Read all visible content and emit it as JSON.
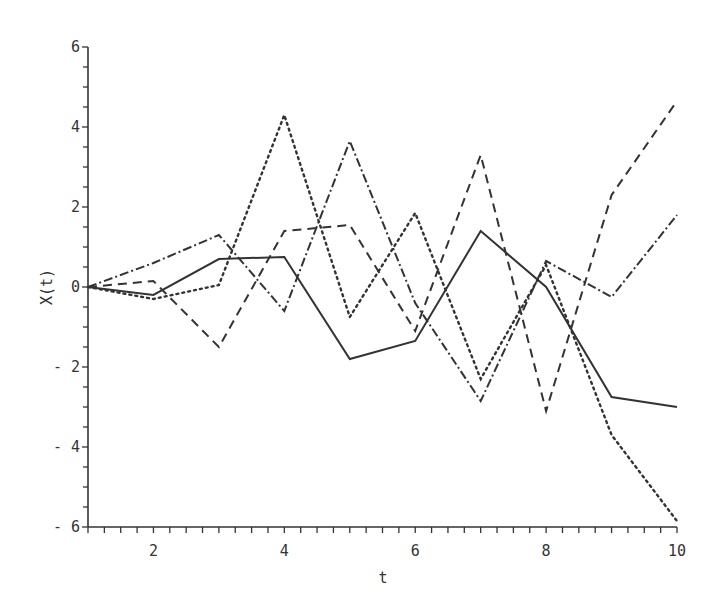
{
  "chart_data": {
    "type": "line",
    "title": "",
    "xlabel": "t",
    "ylabel": "X(t)",
    "xlim": [
      1,
      10
    ],
    "ylim": [
      -6,
      6
    ],
    "x_ticks": [
      2,
      4,
      6,
      8,
      10
    ],
    "y_ticks": [
      -6,
      -4,
      -2,
      0,
      2,
      4,
      6
    ],
    "x_tick_labels": [
      "2",
      "4",
      "6",
      "8",
      "10"
    ],
    "y_tick_labels": [
      "-6",
      "-4",
      "-2",
      "0",
      "2",
      "4",
      "6"
    ],
    "grid": false,
    "legend": null,
    "x": [
      1,
      2,
      3,
      4,
      5,
      6,
      7,
      8,
      9,
      10
    ],
    "series": [
      {
        "name": "solid",
        "style": "solid",
        "color": "#333333",
        "values": [
          0,
          -0.2,
          0.7,
          0.75,
          -1.8,
          -1.35,
          1.4,
          0.0,
          -2.75,
          -3.0
        ]
      },
      {
        "name": "dashed",
        "style": "dashed",
        "color": "#333333",
        "values": [
          0,
          0.15,
          -1.5,
          1.4,
          1.55,
          -1.1,
          3.3,
          -3.1,
          2.3,
          4.65
        ]
      },
      {
        "name": "dotted",
        "style": "dotted",
        "color": "#333333",
        "values": [
          0,
          -0.3,
          0.05,
          4.3,
          -0.75,
          1.85,
          -2.3,
          0.55,
          -3.7,
          -5.85
        ]
      },
      {
        "name": "dash-dot",
        "style": "dashdot",
        "color": "#333333",
        "values": [
          0,
          0.6,
          1.3,
          -0.6,
          3.65,
          -0.4,
          -2.85,
          0.65,
          -0.25,
          1.8
        ]
      }
    ]
  }
}
